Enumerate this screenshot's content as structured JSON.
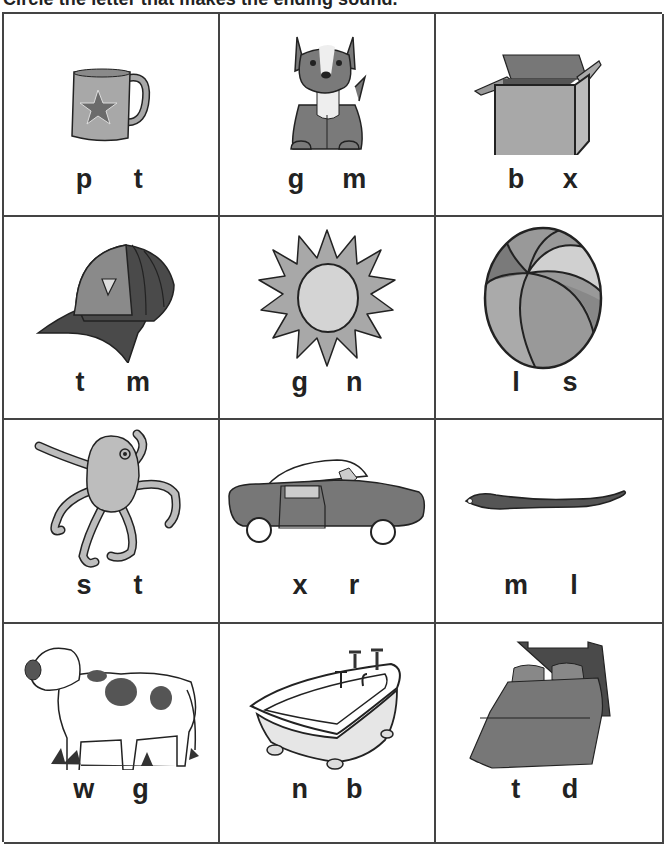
{
  "worksheet": {
    "instruction": "Circle the letter that makes the ending sound.",
    "colors": {
      "ink": "#222222",
      "gridline": "#444444",
      "light_gray": "#c8c8c8",
      "mid_gray": "#a8a8a8",
      "dark_gray": "#6b6b6b",
      "darkest_gray": "#4a4a4a"
    },
    "rows": [
      {
        "cells": [
          {
            "picture": "mug",
            "icon": "mug-icon",
            "choices": [
              "p",
              "t"
            ]
          },
          {
            "picture": "dog",
            "icon": "dog-icon",
            "choices": [
              "g",
              "m"
            ]
          },
          {
            "picture": "box",
            "icon": "box-icon",
            "choices": [
              "b",
              "x"
            ]
          }
        ]
      },
      {
        "cells": [
          {
            "picture": "hat",
            "icon": "cap-icon",
            "choices": [
              "t",
              "m"
            ]
          },
          {
            "picture": "sun",
            "icon": "sun-icon",
            "choices": [
              "g",
              "n"
            ]
          },
          {
            "picture": "ball",
            "icon": "ball-icon",
            "choices": [
              "l",
              "s"
            ]
          }
        ]
      },
      {
        "cells": [
          {
            "picture": "octopus",
            "icon": "octopus-icon",
            "choices": [
              "s",
              "t"
            ]
          },
          {
            "picture": "car",
            "icon": "car-icon",
            "choices": [
              "x",
              "r"
            ]
          },
          {
            "picture": "worm",
            "icon": "worm-icon",
            "choices": [
              "m",
              "l"
            ]
          }
        ]
      },
      {
        "cells": [
          {
            "picture": "cow",
            "icon": "cow-icon",
            "choices": [
              "w",
              "g"
            ]
          },
          {
            "picture": "tub",
            "icon": "bathtub-icon",
            "choices": [
              "n",
              "b"
            ]
          },
          {
            "picture": "bed",
            "icon": "bed-icon",
            "choices": [
              "t",
              "d"
            ]
          }
        ]
      }
    ]
  }
}
